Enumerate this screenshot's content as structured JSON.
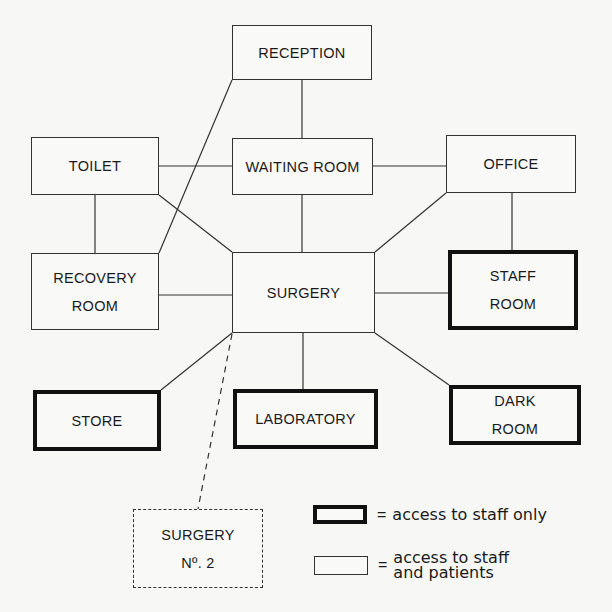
{
  "diagram": {
    "type": "room relationship / access diagram",
    "rooms": [
      {
        "id": "reception",
        "label_lines": [
          "RECEPTION"
        ],
        "access": "staff_and_patients"
      },
      {
        "id": "toilet",
        "label_lines": [
          "TOILET"
        ],
        "access": "staff_and_patients"
      },
      {
        "id": "waiting_room",
        "label_lines": [
          "WAITING ROOM"
        ],
        "access": "staff_and_patients"
      },
      {
        "id": "office",
        "label_lines": [
          "OFFICE"
        ],
        "access": "staff_and_patients"
      },
      {
        "id": "recovery_room",
        "label_lines": [
          "RECOVERY",
          "ROOM"
        ],
        "access": "staff_and_patients"
      },
      {
        "id": "surgery",
        "label_lines": [
          "SURGERY"
        ],
        "access": "staff_and_patients"
      },
      {
        "id": "staff_room",
        "label_lines": [
          "STAFF",
          "ROOM"
        ],
        "access": "staff_only"
      },
      {
        "id": "store",
        "label_lines": [
          "STORE"
        ],
        "access": "staff_only"
      },
      {
        "id": "laboratory",
        "label_lines": [
          "LABORATORY"
        ],
        "access": "staff_only"
      },
      {
        "id": "dark_room",
        "label_lines": [
          "DARK",
          "ROOM"
        ],
        "access": "staff_only"
      },
      {
        "id": "surgery_no2",
        "label_lines": [
          "SURGERY",
          "Nº. 2"
        ],
        "access": "future/optional (dashed)"
      }
    ],
    "connections": [
      [
        "reception",
        "waiting_room"
      ],
      [
        "reception",
        "recovery_room"
      ],
      [
        "toilet",
        "waiting_room"
      ],
      [
        "toilet",
        "recovery_room"
      ],
      [
        "toilet",
        "surgery"
      ],
      [
        "waiting_room",
        "office"
      ],
      [
        "waiting_room",
        "surgery"
      ],
      [
        "office",
        "surgery"
      ],
      [
        "office",
        "staff_room"
      ],
      [
        "recovery_room",
        "surgery"
      ],
      [
        "surgery",
        "staff_room"
      ],
      [
        "surgery",
        "store"
      ],
      [
        "surgery",
        "laboratory"
      ],
      [
        "surgery",
        "dark_room"
      ],
      {
        "from": "surgery",
        "to": "surgery_no2",
        "style": "dashed"
      }
    ]
  },
  "labels": {
    "reception": "RECEPTION",
    "toilet": "TOILET",
    "waiting_room": "WAITING ROOM",
    "office": "OFFICE",
    "recovery_1": "RECOVERY",
    "recovery_2": "ROOM",
    "surgery": "SURGERY",
    "staff_1": "STAFF",
    "staff_2": "ROOM",
    "store": "STORE",
    "laboratory": "LABORATORY",
    "dark_1": "DARK",
    "dark_2": "ROOM",
    "surgery2_1": "SURGERY",
    "surgery2_2": "Nº. 2"
  },
  "legend": {
    "equals": "=",
    "staff_only": "access to staff only",
    "staff_and_patients_1": "access to staff",
    "staff_and_patients_2": "and patients"
  },
  "colors": {
    "line": "#333333",
    "thick_border": "#111111",
    "background": "#f7f7f5"
  }
}
